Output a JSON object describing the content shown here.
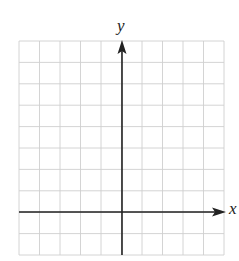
{
  "diagram": {
    "type": "coordinate-grid",
    "axes": {
      "x_label": "x",
      "y_label": "y",
      "axis_color": "#222222"
    },
    "grid": {
      "columns": 10,
      "rows": 10,
      "y_axis_column_index": 5,
      "x_axis_row_index_from_top": 8,
      "line_color": "#cfcfcf"
    }
  }
}
